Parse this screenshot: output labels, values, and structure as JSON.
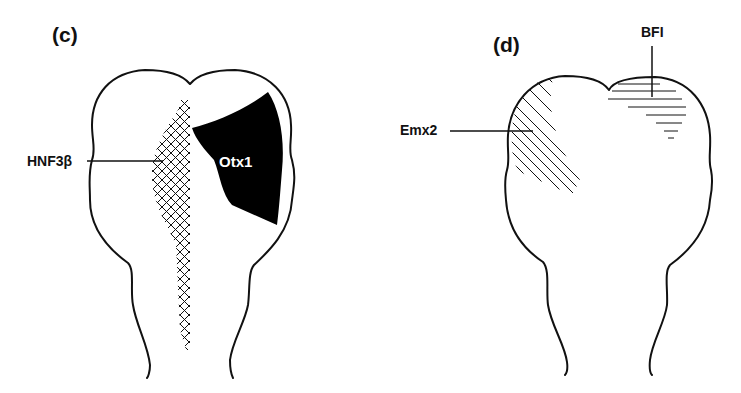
{
  "figure": {
    "panels": [
      {
        "id": "c",
        "label": "(c)",
        "genes": [
          {
            "name": "HNF3β",
            "pattern": "cross-hatched",
            "region": "midline strip"
          },
          {
            "name": "Otx1",
            "pattern": "solid-black",
            "region": "right forebrain/midbrain"
          }
        ]
      },
      {
        "id": "d",
        "label": "(d)",
        "genes": [
          {
            "name": "Emx2",
            "pattern": "diagonal-hatched",
            "region": "left dorsal forebrain"
          },
          {
            "name": "BFI",
            "pattern": "horizontal-hatched",
            "region": "right anterior telencephalon"
          }
        ]
      }
    ],
    "colors": {
      "ink": "#111111",
      "background": "#ffffff"
    }
  }
}
